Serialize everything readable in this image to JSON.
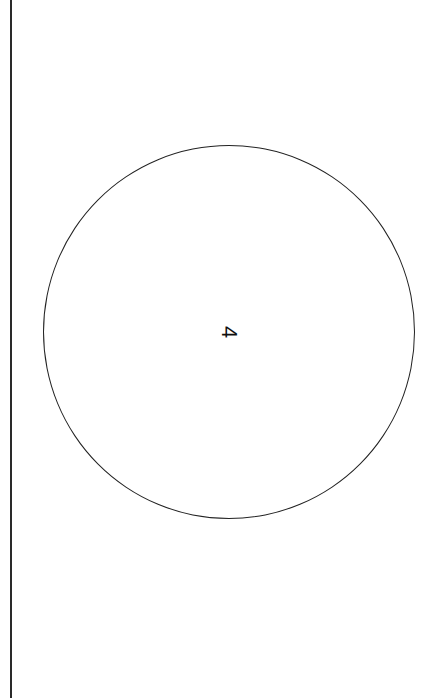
{
  "diagram": {
    "shape": "circle",
    "label": "4",
    "label_rotation_deg": 90,
    "stroke_color": "#222222",
    "background": "#ffffff",
    "left_border_color": "#2a2a2a"
  }
}
